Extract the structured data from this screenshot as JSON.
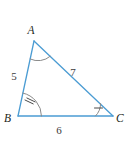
{
  "figure": {
    "kind": "triangle-diagram",
    "background_color": "#ffffff",
    "edge_color": "#4b9cd3",
    "arc_color": "#8a8a8a",
    "tick_color": "#4a4a4a",
    "label_color": "#231f20",
    "side_label_color": "#3b3b3b",
    "vertices": {
      "A": {
        "label": "A",
        "x": 34,
        "y": 41,
        "label_x": 31,
        "label_y": 34
      },
      "B": {
        "label": "B",
        "x": 18,
        "y": 116,
        "label_x": 4,
        "label_y": 122
      },
      "C": {
        "label": "C",
        "x": 113,
        "y": 116,
        "label_x": 116,
        "label_y": 122
      }
    },
    "sides": [
      {
        "name": "AB",
        "length": "5",
        "label_x": 14,
        "label_y": 80
      },
      {
        "name": "AC",
        "length": "7",
        "label_x": 73,
        "label_y": 76
      },
      {
        "name": "BC",
        "length": "6",
        "label_x": 59,
        "label_y": 134
      }
    ],
    "angle_marks": [
      {
        "vertex": "A",
        "ticks": 0
      },
      {
        "vertex": "B",
        "ticks": 2
      },
      {
        "vertex": "C",
        "ticks": 1
      }
    ]
  }
}
